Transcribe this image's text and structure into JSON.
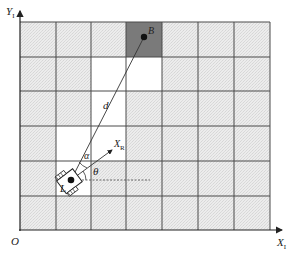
{
  "diagram": {
    "axes": {
      "y_label": "Y",
      "y_sub": "I",
      "x_label": "X",
      "x_sub": "I",
      "origin_label": "O"
    },
    "grid": {
      "cols": 7,
      "rows": 6,
      "pattern_color": "#e6e6e6",
      "line_color": "#444444",
      "free_cells": [
        [
          2,
          1
        ],
        [
          3,
          1
        ],
        [
          2,
          2
        ],
        [
          1,
          3
        ],
        [
          2,
          3
        ],
        [
          1,
          4
        ]
      ],
      "goal_cell": [
        3,
        0
      ],
      "goal_color": "#7a7a7a"
    },
    "labels": {
      "goal": "B",
      "robot": "L",
      "distance": "d",
      "robot_axis": "X",
      "robot_axis_sub": "R",
      "alpha": "α",
      "theta": "θ"
    }
  }
}
